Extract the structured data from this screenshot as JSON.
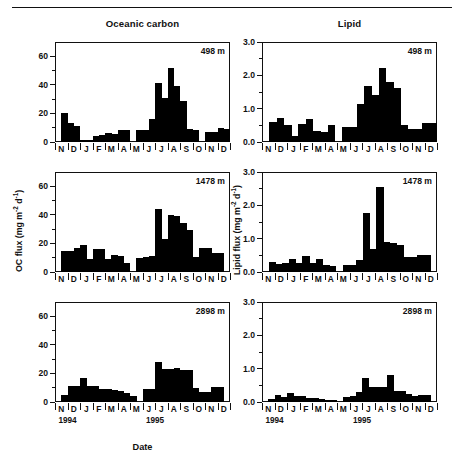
{
  "figure": {
    "columns": [
      {
        "id": "oceanic-carbon",
        "title": "Oceanic carbon"
      },
      {
        "id": "lipid",
        "title": "Lipid"
      }
    ],
    "x_axis_title": "Date",
    "year_labels": [
      "1994",
      "1995"
    ],
    "month_labels": [
      "N",
      "D",
      "J",
      "F",
      "M",
      "A",
      "M",
      "J",
      "J",
      "A",
      "S",
      "O",
      "N",
      "D"
    ],
    "depth_labels": [
      "498 m",
      "1478 m",
      "2898 m"
    ],
    "colors": {
      "bar": "#000000",
      "axis": "#111111",
      "background": "#ffffff"
    }
  },
  "axes": {
    "oc": {
      "label_text": "OC flux (mg m",
      "label_sup1": "-2",
      "label_mid": " d",
      "label_sup2": "-1",
      "label_end": ")",
      "label_plain": "OC flux (mg m-2 d-1)",
      "ticks": [
        "0",
        "20",
        "40",
        "60"
      ],
      "ymin": 0,
      "ymax": 70,
      "tick_values": [
        0,
        20,
        40,
        60
      ],
      "minor_values": [
        10,
        30,
        50
      ]
    },
    "lipid": {
      "label_text": "Lipid flux (mg m",
      "label_sup1": "-2",
      "label_mid": " d",
      "label_sup2": "-1",
      "label_end": ")",
      "label_plain": "Lipid flux (mg m-2 d-1)",
      "ticks": [
        "0.0",
        "1.0",
        "2.0",
        "3.0"
      ],
      "ymin": 0,
      "ymax": 3.0,
      "tick_values": [
        0,
        1.0,
        2.0,
        3.0
      ],
      "minor_values": [
        0.5,
        1.5,
        2.5
      ]
    }
  },
  "chart_data": [
    {
      "type": "bar",
      "id": "oc-498",
      "title": "Oceanic carbon",
      "annotation": "498 m",
      "xlabel": "Date",
      "ylabel": "OC flux (mg m-2 d-1)",
      "ylim": [
        0,
        70
      ],
      "grid": false,
      "x_tick_labels": [
        "N",
        "D",
        "J",
        "F",
        "M",
        "A",
        "M",
        "J",
        "J",
        "A",
        "S",
        "O",
        "N",
        "D"
      ],
      "x_year_spans": [
        "1994",
        "1995"
      ],
      "values": [
        0,
        20.3,
        13.3,
        11.0,
        1.3,
        1.7,
        4.3,
        4.7,
        6.2,
        5.8,
        8.5,
        8.7,
        0,
        8.2,
        8.6,
        16.0,
        41.2,
        30.5,
        51.8,
        39.2,
        28.6,
        8.8,
        8.5,
        0,
        6.8,
        6.8,
        9.5,
        9.2
      ],
      "n_samples": 28,
      "gaps": [
        0,
        12,
        23
      ]
    },
    {
      "type": "bar",
      "id": "oc-1478",
      "title": "Oceanic carbon",
      "annotation": "1478 m",
      "xlabel": "Date",
      "ylabel": "OC flux (mg m-2 d-1)",
      "ylim": [
        0,
        70
      ],
      "grid": false,
      "x_tick_labels": [
        "N",
        "D",
        "J",
        "F",
        "M",
        "A",
        "M",
        "J",
        "J",
        "A",
        "S",
        "O",
        "N",
        "D"
      ],
      "x_year_spans": [
        "1994",
        "1995"
      ],
      "values": [
        0,
        14.8,
        15.0,
        16.5,
        19.2,
        9.0,
        16.0,
        16.2,
        9.2,
        11.6,
        11.5,
        6.6,
        0,
        9.8,
        10.2,
        11.4,
        44.4,
        22.8,
        39.8,
        39.4,
        34.6,
        29.5,
        10.2,
        17.0,
        17.0,
        13.2,
        13.2,
        0
      ],
      "n_samples": 28,
      "gaps": [
        0,
        12,
        27
      ]
    },
    {
      "type": "bar",
      "id": "oc-2898",
      "title": "Oceanic carbon",
      "annotation": "2898 m",
      "xlabel": "Date",
      "ylabel": "OC flux (mg m-2 d-1)",
      "ylim": [
        0,
        70
      ],
      "grid": false,
      "x_tick_labels": [
        "N",
        "D",
        "J",
        "F",
        "M",
        "A",
        "M",
        "J",
        "J",
        "A",
        "S",
        "O",
        "N",
        "D"
      ],
      "x_year_spans": [
        "1994",
        "1995"
      ],
      "values": [
        0,
        5.0,
        11.2,
        11.2,
        17.0,
        11.5,
        11.0,
        9.0,
        8.8,
        8.5,
        8.0,
        6.5,
        4.5,
        0,
        8.8,
        9.0,
        27.8,
        23.2,
        22.8,
        24.0,
        22.2,
        22.2,
        9.8,
        7.0,
        7.0,
        10.8,
        10.8,
        0
      ],
      "n_samples": 28,
      "gaps": [
        0,
        13,
        27
      ]
    },
    {
      "type": "bar",
      "id": "lipid-498",
      "title": "Lipid",
      "annotation": "498 m",
      "xlabel": "Date",
      "ylabel": "Lipid flux (mg m-2 d-1)",
      "ylim": [
        0,
        3.0
      ],
      "grid": false,
      "x_tick_labels": [
        "N",
        "D",
        "J",
        "F",
        "M",
        "A",
        "M",
        "J",
        "J",
        "A",
        "S",
        "O",
        "N",
        "D"
      ],
      "x_year_spans": [
        "1994",
        "1995"
      ],
      "values": [
        0,
        0.6,
        0.72,
        0.5,
        0.17,
        0.55,
        0.68,
        0.33,
        0.3,
        0.52,
        0,
        0.46,
        0.46,
        1.13,
        1.69,
        1.41,
        2.22,
        1.79,
        1.62,
        0.52,
        0.38,
        0.38,
        0.56,
        0.57
      ],
      "n_samples": 24,
      "gaps": [
        0,
        10
      ]
    },
    {
      "type": "bar",
      "id": "lipid-1478",
      "title": "Lipid",
      "annotation": "1478 m",
      "xlabel": "Date",
      "ylabel": "Lipid flux (mg m-2 d-1)",
      "ylim": [
        0,
        3.0
      ],
      "grid": false,
      "x_tick_labels": [
        "N",
        "D",
        "J",
        "F",
        "M",
        "A",
        "M",
        "J",
        "J",
        "A",
        "S",
        "O",
        "N",
        "D"
      ],
      "x_year_spans": [
        "1994",
        "1995"
      ],
      "values": [
        0,
        0.31,
        0.24,
        0.26,
        0.4,
        0.26,
        0.48,
        0.26,
        0.38,
        0.2,
        0.18,
        0,
        0.21,
        0.22,
        0.36,
        1.77,
        0.7,
        2.54,
        0.9,
        0.88,
        0.8,
        0.45,
        0.45,
        0.5,
        0.5,
        0
      ],
      "n_samples": 26,
      "gaps": [
        0,
        11,
        25
      ]
    },
    {
      "type": "bar",
      "id": "lipid-2898",
      "title": "Lipid",
      "annotation": "2898 m",
      "xlabel": "Date",
      "ylabel": "Lipid flux (mg m-2 d-1)",
      "ylim": [
        0,
        3.0
      ],
      "grid": false,
      "x_tick_labels": [
        "N",
        "D",
        "J",
        "F",
        "M",
        "A",
        "M",
        "J",
        "J",
        "A",
        "S",
        "O",
        "N",
        "D"
      ],
      "x_year_spans": [
        "1994",
        "1995"
      ],
      "values": [
        0,
        0.1,
        0.2,
        0.16,
        0.28,
        0.18,
        0.18,
        0.12,
        0.12,
        0.1,
        0.06,
        0.05,
        0,
        0.16,
        0.18,
        0.3,
        0.72,
        0.45,
        0.44,
        0.44,
        0.8,
        0.34,
        0.34,
        0.25,
        0.18,
        0.2,
        0.2,
        0
      ],
      "n_samples": 28,
      "gaps": [
        0,
        12,
        27
      ]
    }
  ]
}
